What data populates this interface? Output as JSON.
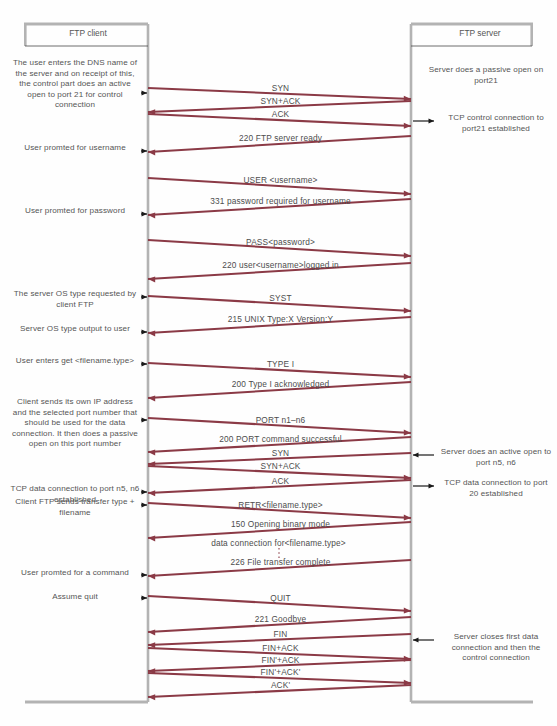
{
  "diagram": {
    "line_color": "#8b3a46",
    "rule_color": "#b3b3b3",
    "text_color": "#555555",
    "client_header": "FTP client",
    "server_header": "FTP server",
    "client_lifeline_x": 148,
    "server_lifeline_x": 411
  },
  "messages": [
    {
      "label": "SYN",
      "dir": "right",
      "y_start": 88,
      "y_end": 99
    },
    {
      "label": "SYN+ACK",
      "dir": "left",
      "y_start": 101,
      "y_end": 112
    },
    {
      "label": "ACK",
      "dir": "right",
      "y_start": 114,
      "y_end": 126
    },
    {
      "label": "220 FTP server ready",
      "dir": "left",
      "y_start": 136,
      "y_end": 152
    },
    {
      "label": "USER <username>",
      "dir": "right",
      "y_start": 178,
      "y_end": 194
    },
    {
      "label": "331 password required for username",
      "dir": "left",
      "y_start": 199,
      "y_end": 215
    },
    {
      "label": "PASS<password>",
      "dir": "right",
      "y_start": 240,
      "y_end": 256
    },
    {
      "label": "220 user<username>logged in",
      "dir": "left",
      "y_start": 263,
      "y_end": 279
    },
    {
      "label": "SYST",
      "dir": "right",
      "y_start": 296,
      "y_end": 311
    },
    {
      "label": "215 UNIX Type:X Version:Y",
      "dir": "left",
      "y_start": 317,
      "y_end": 333
    },
    {
      "label": "TYPE I",
      "dir": "right",
      "y_start": 363,
      "y_end": 377
    },
    {
      "label": "200 Type I acknowledged",
      "dir": "left",
      "y_start": 382,
      "y_end": 398
    },
    {
      "label": "PORT n1–n6",
      "dir": "right",
      "y_start": 418,
      "y_end": 433
    },
    {
      "label": "200 PORT command successful",
      "dir": "left",
      "y_start": 437,
      "y_end": 452
    },
    {
      "label": "SYN",
      "dir": "left",
      "y_start": 453,
      "y_end": 464
    },
    {
      "label": "SYN+ACK",
      "dir": "right",
      "y_start": 466,
      "y_end": 478
    },
    {
      "label": "ACK",
      "dir": "left",
      "y_start": 480,
      "y_end": 493
    },
    {
      "label": "RETR<filename.type>",
      "dir": "right",
      "y_start": 503,
      "y_end": 518
    },
    {
      "label": "150 Opening binary mode",
      "dir": "left",
      "y_start": 522,
      "y_end": 538
    },
    {
      "label": "226 File transfer complete",
      "dir": "left",
      "y_start": 560,
      "y_end": 576
    },
    {
      "label": "QUIT",
      "dir": "right",
      "y_start": 596,
      "y_end": 611
    },
    {
      "label": "221 Goodbye",
      "dir": "left",
      "y_start": 617,
      "y_end": 632
    },
    {
      "label": "FIN",
      "dir": "left",
      "y_start": 634,
      "y_end": 645
    },
    {
      "label": "FIN+ACK",
      "dir": "right",
      "y_start": 648,
      "y_end": 659
    },
    {
      "label": "FIN'+ACK",
      "dir": "left",
      "y_start": 660,
      "y_end": 671
    },
    {
      "label": "FIN'+ACK'",
      "dir": "right",
      "y_start": 673,
      "y_end": 683
    },
    {
      "label": "ACK'",
      "dir": "left",
      "y_start": 685,
      "y_end": 697
    }
  ],
  "inline_labels": [
    {
      "text": "data connection for<filename.type>",
      "x": 278,
      "y": 543
    }
  ],
  "client_notes": [
    {
      "text": "The user enters the DNS name of the server and on receipt of this, the control part does an active open to port 21 for control connection",
      "x": 10,
      "y": 58,
      "w": 130,
      "arrow_y": 93
    },
    {
      "text": "User promted for username",
      "x": 10,
      "y": 143,
      "w": 130,
      "arrow_y": 151
    },
    {
      "text": "User promted for password",
      "x": 10,
      "y": 206,
      "w": 130,
      "arrow_y": 214
    },
    {
      "text": "The server OS type requested by client FTP",
      "x": 10,
      "y": 289,
      "w": 130,
      "arrow_y": 297
    },
    {
      "text": "Server OS type output to user",
      "x": 10,
      "y": 324,
      "w": 130,
      "arrow_y": 332
    },
    {
      "text": "User enters get <filename.type>",
      "x": 10,
      "y": 356,
      "w": 130,
      "arrow_y": 364
    },
    {
      "text": "Client sends its own IP address and the selected port number that should be used for the data connection. It then does a passive open on this port number",
      "x": 10,
      "y": 397,
      "w": 130,
      "arrow_y": 420
    },
    {
      "text": "TCP data connection to port n5, n6 established",
      "x": 10,
      "y": 484,
      "w": 130,
      "arrow_y": 492
    },
    {
      "text": "Client FTP sends transfer type + filename",
      "x": 10,
      "y": 497,
      "w": 130,
      "arrow_y": 505
    },
    {
      "text": "User promted for a command",
      "x": 10,
      "y": 568,
      "w": 130,
      "arrow_y": 575
    },
    {
      "text": "Assume quit",
      "x": 10,
      "y": 592,
      "w": 130,
      "arrow_y": 598
    }
  ],
  "server_notes": [
    {
      "text": "Server does a passive open on port21",
      "x": 425,
      "y": 65,
      "w": 122,
      "arrow_y": null
    },
    {
      "text": "TCP control connection to port21 established",
      "x": 440,
      "y": 113,
      "w": 112,
      "arrow_y": 121,
      "arrow_dir": "right"
    },
    {
      "text": "Server does an active open to port n5, n6",
      "x": 440,
      "y": 447,
      "w": 112,
      "arrow_y": 455,
      "arrow_dir": "left"
    },
    {
      "text": "TCP data connection to port 20 established",
      "x": 440,
      "y": 478,
      "w": 112,
      "arrow_y": 486,
      "arrow_dir": "right"
    },
    {
      "text": "Server closes first data connection and then the control connection",
      "x": 440,
      "y": 632,
      "w": 112,
      "arrow_y": 640,
      "arrow_dir": "left"
    }
  ]
}
